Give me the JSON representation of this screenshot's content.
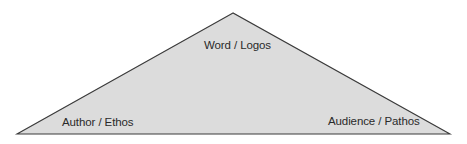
{
  "diagram": {
    "type": "rhetorical-triangle",
    "colors": {
      "fill": "#dcdcdc",
      "stroke": "#3a3a3a",
      "text": "#2a2a2a",
      "background": "#ffffff"
    },
    "vertices": {
      "top": {
        "label": "Word / Logos"
      },
      "left": {
        "label": "Author / Ethos"
      },
      "right": {
        "label": "Audience / Pathos"
      }
    }
  }
}
